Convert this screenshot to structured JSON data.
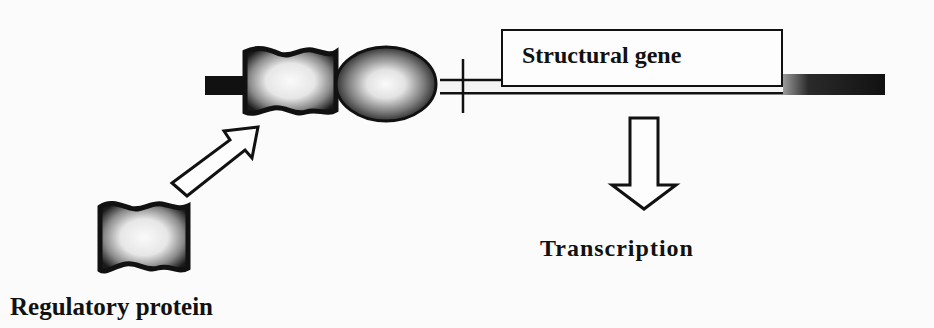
{
  "diagram": {
    "labels": {
      "structural_gene": "Structural gene",
      "transcription": "Transcription",
      "regulatory_protein": "Regulatory protein"
    },
    "elements": [
      {
        "id": "dna-strand",
        "shape": "horizontal-bar",
        "description": "DNA double strand"
      },
      {
        "id": "bound-regulatory-protein",
        "shape": "wavy-square",
        "description": "Regulatory protein bound to DNA"
      },
      {
        "id": "rna-polymerase",
        "shape": "oval",
        "description": "Promoter-bound oval (RNA polymerase)"
      },
      {
        "id": "transcription-start-marker",
        "shape": "vertical-tick"
      },
      {
        "id": "structural-gene-box",
        "shape": "rectangle",
        "label_ref": "structural_gene"
      },
      {
        "id": "free-regulatory-protein",
        "shape": "wavy-square",
        "label_ref": "regulatory_protein"
      },
      {
        "id": "binding-arrow",
        "shape": "hollow-arrow",
        "direction": "up-right"
      },
      {
        "id": "transcription-arrow",
        "shape": "hollow-arrow",
        "direction": "down",
        "label_ref": "transcription"
      }
    ],
    "colors": {
      "ink": "#111111",
      "background": "#fbfbfb",
      "fill_light": "#f2f2f2"
    }
  }
}
